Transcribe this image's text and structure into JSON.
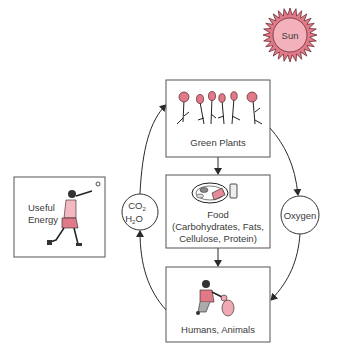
{
  "colors": {
    "accent_pink": "#e07a88",
    "light_pink": "#f4b8c0",
    "sun_fill": "#f2a6b1",
    "line": "#2a2a2a",
    "text": "#3a3a3a"
  },
  "sun": {
    "label": "Sun"
  },
  "nodes": {
    "green_plants": {
      "label": "Green Plants"
    },
    "food": {
      "line1": "Food",
      "line2": "(Carbohydrates, Fats,",
      "line3": "Cellulose, Protein)"
    },
    "humans_animals": {
      "label": "Humans, Animals"
    },
    "useful_energy": {
      "line1": "Useful",
      "line2": "Energy"
    },
    "co2_h2o": {
      "co": "CO",
      "co_sub": "2",
      "h": "H",
      "h_sub": "2",
      "o": "O"
    },
    "oxygen": {
      "label": "Oxygen"
    }
  },
  "icons": {
    "sun": "sun-icon",
    "plants": "flowers-icon",
    "food": "plate-of-food-icon",
    "humans": "person-with-dog-icon",
    "energy": "person-throwing-ball-icon"
  }
}
